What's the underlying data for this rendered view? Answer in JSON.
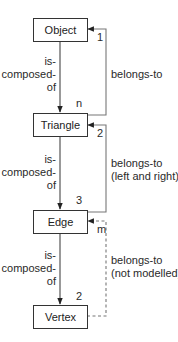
{
  "diagram": {
    "type": "entity-relationship",
    "entities": [
      {
        "id": "object",
        "label": "Object"
      },
      {
        "id": "triangle",
        "label": "Triangle"
      },
      {
        "id": "edge",
        "label": "Edge"
      },
      {
        "id": "vertex",
        "label": "Vertex"
      }
    ],
    "composition_relations": [
      {
        "from": "object",
        "to": "triangle",
        "label_lines": [
          "is-",
          "composed-",
          "of"
        ],
        "multiplicity": "n"
      },
      {
        "from": "triangle",
        "to": "edge",
        "label_lines": [
          "is-",
          "composed-",
          "of"
        ],
        "multiplicity": "3"
      },
      {
        "from": "edge",
        "to": "vertex",
        "label_lines": [
          "is-",
          "composed-",
          "of"
        ],
        "multiplicity": "2"
      }
    ],
    "belongs_relations": [
      {
        "from": "triangle",
        "to": "object",
        "label_lines": [
          "belongs-to"
        ],
        "multiplicity": "1",
        "style": "solid"
      },
      {
        "from": "edge",
        "to": "triangle",
        "label_lines": [
          "belongs-to",
          "(left and right)"
        ],
        "multiplicity": "2",
        "style": "solid"
      },
      {
        "from": "vertex",
        "to": "edge",
        "label_lines": [
          "belongs-to",
          "(not modelled)"
        ],
        "multiplicity": "m",
        "style": "dashed"
      }
    ]
  },
  "colors": {
    "line": "#555555",
    "box_border": "#333333",
    "text": "#222222",
    "background": "#ffffff"
  }
}
